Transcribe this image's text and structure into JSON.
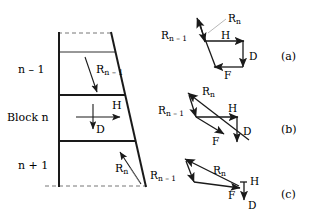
{
  "figure": {
    "stroke_color": "#1a1a1a",
    "leader_color": "#8a8a8a"
  },
  "block_diagram": {
    "name": "block-column",
    "labels": {
      "upper_block": "n – 1",
      "middle_block": "Block n",
      "lower_block": "n + 1"
    },
    "vectors": [
      {
        "name": "R_n_minus_1",
        "base": "R",
        "sub": "n – 1",
        "label_x": 96,
        "label_y": 64
      },
      {
        "name": "H",
        "base": "H",
        "sub": "",
        "label_x": 112,
        "label_y": 100
      },
      {
        "name": "D",
        "base": "D",
        "sub": "",
        "label_x": 96,
        "label_y": 124
      },
      {
        "name": "R_n",
        "base": "R",
        "sub": "n",
        "label_x": 115,
        "label_y": 163
      }
    ]
  },
  "force_polygons": [
    {
      "name": "polygon-a",
      "caption": "(a)",
      "caption_x": 281,
      "caption_y": 51,
      "vector_labels": [
        {
          "name": "R_n_minus_1",
          "base": "R",
          "sub": "n – 1",
          "x": 161,
          "y": 30
        },
        {
          "name": "R_n",
          "base": "R",
          "sub": "n",
          "x": 228,
          "y": 13
        },
        {
          "name": "H",
          "base": "H",
          "sub": "",
          "x": 221,
          "y": 30
        },
        {
          "name": "D",
          "base": "D",
          "sub": "",
          "x": 249,
          "y": 51
        },
        {
          "name": "F",
          "base": "F",
          "sub": "",
          "x": 224,
          "y": 70
        }
      ]
    },
    {
      "name": "polygon-b",
      "caption": "(b)",
      "caption_x": 281,
      "caption_y": 124,
      "vector_labels": [
        {
          "name": "R_n_minus_1",
          "base": "R",
          "sub": "n – 1",
          "x": 158,
          "y": 105
        },
        {
          "name": "R_n",
          "base": "R",
          "sub": "n",
          "x": 212,
          "y": 88
        },
        {
          "name": "H",
          "base": "H",
          "sub": "",
          "x": 228,
          "y": 107
        },
        {
          "name": "D",
          "base": "D",
          "sub": "",
          "x": 255,
          "y": 126
        },
        {
          "name": "F",
          "base": "F",
          "sub": "",
          "x": 217,
          "y": 136
        }
      ]
    },
    {
      "name": "polygon-c",
      "caption": "(c)",
      "caption_x": 281,
      "caption_y": 189,
      "vector_labels": [
        {
          "name": "R_n_minus_1",
          "base": "R",
          "sub": "n – 1",
          "x": 152,
          "y": 172
        },
        {
          "name": "R_n",
          "base": "R",
          "sub": "n",
          "x": 218,
          "y": 168
        },
        {
          "name": "H",
          "base": "H",
          "sub": "",
          "x": 250,
          "y": 181
        },
        {
          "name": "F",
          "base": "F",
          "sub": "",
          "x": 228,
          "y": 194
        },
        {
          "name": "D",
          "base": "D",
          "sub": "",
          "x": 248,
          "y": 203
        }
      ]
    }
  ]
}
